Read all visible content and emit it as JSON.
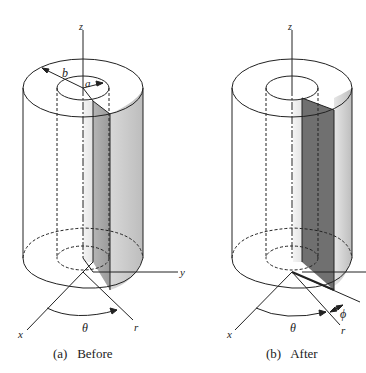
{
  "figure": {
    "panels": [
      {
        "id": "a",
        "caption": "(a)   Before",
        "labels": {
          "z": "z",
          "b": "b",
          "a": "a",
          "y": "y",
          "x": "x",
          "theta": "θ",
          "r": "r"
        }
      },
      {
        "id": "b",
        "caption": "(b)   After",
        "labels": {
          "z": "z",
          "x": "x",
          "theta": "θ",
          "r": "r",
          "phi": "ϕ"
        }
      }
    ],
    "colors": {
      "line": "#222222",
      "dark_face": "#6e6e6e",
      "mid_face": "#a9a9a9",
      "light_face": "#cfcfcf",
      "background": "#ffffff"
    }
  }
}
